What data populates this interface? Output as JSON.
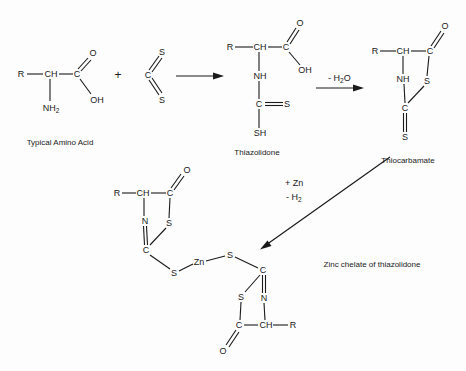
{
  "diagram": {
    "type": "chemical-reaction-scheme",
    "background": "#ffffff",
    "ink_color": "#1a1a1a",
    "compounds": {
      "amino_acid": {
        "caption": "Typical Amino Acid",
        "atoms": {
          "r": "R",
          "ch": "CH",
          "c": "C",
          "o": "O",
          "oh": "OH",
          "n": "NH",
          "n_sub": "2"
        }
      },
      "carbon_disulfide": {
        "atoms": {
          "c": "C",
          "s_top": "S",
          "s_bottom": "S"
        }
      },
      "thiazolidone": {
        "caption": "Thiazolidone",
        "atoms": {
          "r": "R",
          "ch": "CH",
          "c": "C",
          "o": "O",
          "oh": "OH",
          "nh": "NH",
          "c2": "C",
          "s": "S",
          "sh": "SH"
        }
      },
      "thiocarbamate": {
        "caption": "Thiocarbamate",
        "atoms": {
          "r": "R",
          "ch": "CH",
          "c": "C",
          "o": "O",
          "s_ring": "S",
          "nh": "NH",
          "c2": "C",
          "s_exo": "S"
        }
      },
      "zinc_chelate": {
        "caption": "Zinc chelate of thiazolidone",
        "left_ring": {
          "r": "R",
          "ch": "CH",
          "c": "C",
          "o": "O",
          "n": "N",
          "s_ring": "S",
          "c2": "C",
          "s_link": "S"
        },
        "metal": "Zn",
        "right_ring": {
          "s_link": "S",
          "c2": "C",
          "s_ring": "S",
          "n": "N",
          "c": "C",
          "ch": "CH",
          "r": "R",
          "o": "O"
        }
      }
    },
    "operators": {
      "plus": "+"
    },
    "conditions": {
      "dehydration": {
        "prefix": "- H",
        "sub": "2",
        "suffix": "O"
      },
      "zinc_add": "+ Zn",
      "hydrogen_loss": {
        "prefix": "- H",
        "sub": "2"
      }
    },
    "arrows": [
      {
        "name": "arrow-amino-to-thiazolidone",
        "from": [
          176,
          76
        ],
        "to": [
          224,
          76
        ]
      },
      {
        "name": "arrow-thiazolidone-to-thiocarbamate",
        "from": [
          316,
          88
        ],
        "to": [
          364,
          88
        ]
      },
      {
        "name": "arrow-thiocarbamate-to-chelate",
        "from": [
          390,
          157
        ],
        "to": [
          260,
          249
        ]
      }
    ]
  }
}
